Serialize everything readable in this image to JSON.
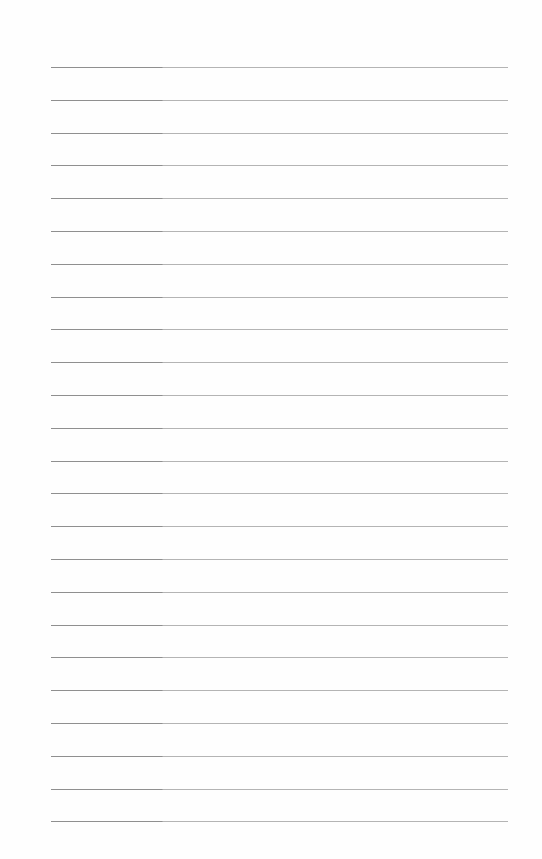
{
  "page": {
    "type": "lined-paper",
    "background": "#fefefe",
    "rule_color": "#b4b4b4",
    "rule_color_left": "#8f8f8f",
    "rule_left": 51,
    "rule_width": 457,
    "first_rule_y": 67,
    "rule_spacing": 32.8,
    "rule_count": 24
  }
}
